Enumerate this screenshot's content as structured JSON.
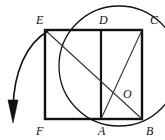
{
  "figure": {
    "background_color": "#ffffff",
    "stroke_color": "#111111",
    "thin_stroke_color": "#333333"
  },
  "labels": [
    {
      "id": "E",
      "text": "E",
      "x": 36,
      "y": 24
    },
    {
      "id": "D",
      "text": "D",
      "x": 99,
      "y": 24
    },
    {
      "id": "C",
      "text": "C",
      "x": 150,
      "y": 24
    },
    {
      "id": "O",
      "text": "O",
      "x": 123,
      "y": 98
    },
    {
      "id": "F",
      "text": "F",
      "x": 36,
      "y": 135
    },
    {
      "id": "A",
      "text": "A",
      "x": 98,
      "y": 135
    },
    {
      "id": "B",
      "text": "B",
      "x": 146,
      "y": 135
    }
  ],
  "points": {
    "E": {
      "x": 45,
      "y": 30
    },
    "D": {
      "x": 101,
      "y": 30
    },
    "C": {
      "x": 142,
      "y": 30
    },
    "F": {
      "x": 45,
      "y": 119
    },
    "A": {
      "x": 101,
      "y": 119
    },
    "B": {
      "x": 142,
      "y": 119
    },
    "O": {
      "x": 120,
      "y": 92
    }
  },
  "circle": {
    "center_x": 119,
    "center_y": 66,
    "radius": 60,
    "stroke_width": 1.3
  },
  "rectangle_outline": {
    "x": 45,
    "y": 30,
    "width": 97,
    "height": 89,
    "stroke_width": 2.4
  },
  "segments": [
    {
      "name": "segment-DA",
      "x1": 101,
      "y1": 30,
      "x2": 101,
      "y2": 119,
      "width": 2.2
    },
    {
      "name": "segment-EB",
      "x1": 45,
      "y1": 30,
      "x2": 142,
      "y2": 119,
      "width": 1.1
    },
    {
      "name": "segment-AC",
      "x1": 101,
      "y1": 119,
      "x2": 142,
      "y2": 30,
      "width": 1.1
    }
  ],
  "arrow": {
    "name": "rotation-arrow",
    "path": "M 48 31 C 26 44, 14 72, 13 108",
    "stroke_width": 1.6,
    "head": "M 13 122 L 8 101 L 18 101 Z"
  }
}
